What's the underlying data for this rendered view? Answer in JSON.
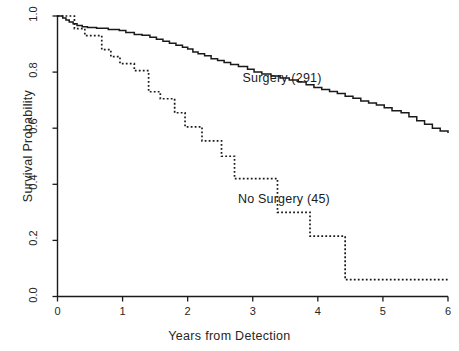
{
  "chart_data": {
    "type": "line",
    "title": "",
    "xlabel": "Years from Detection",
    "ylabel": "Survival Probability",
    "xlim": [
      0,
      6
    ],
    "ylim": [
      0.0,
      1.0
    ],
    "xticks": [
      "0",
      "1",
      "2",
      "3",
      "4",
      "5",
      "6"
    ],
    "yticks": [
      "0.0",
      "0.2",
      "0.4",
      "0.6",
      "0.8",
      "1.0"
    ],
    "grid": false,
    "legend_position": "inline-annotations",
    "plot_style": "kaplan-meier step curves",
    "series": [
      {
        "name": "Surgery (291)",
        "n": 291,
        "linestyle": "solid",
        "color": "#1a1a1a",
        "label_x": 3.45,
        "label_y": 0.775,
        "points": [
          [
            0.0,
            1.0
          ],
          [
            0.08,
            0.993
          ],
          [
            0.13,
            0.986
          ],
          [
            0.18,
            0.979
          ],
          [
            0.24,
            0.972
          ],
          [
            0.3,
            0.966
          ],
          [
            0.38,
            0.962
          ],
          [
            0.46,
            0.959
          ],
          [
            0.6,
            0.956
          ],
          [
            0.78,
            0.952
          ],
          [
            0.95,
            0.948
          ],
          [
            1.05,
            0.941
          ],
          [
            1.18,
            0.934
          ],
          [
            1.3,
            0.931
          ],
          [
            1.42,
            0.924
          ],
          [
            1.52,
            0.917
          ],
          [
            1.62,
            0.91
          ],
          [
            1.72,
            0.903
          ],
          [
            1.82,
            0.896
          ],
          [
            1.92,
            0.889
          ],
          [
            2.0,
            0.882
          ],
          [
            2.08,
            0.872
          ],
          [
            2.16,
            0.865
          ],
          [
            2.26,
            0.858
          ],
          [
            2.36,
            0.848
          ],
          [
            2.46,
            0.841
          ],
          [
            2.56,
            0.834
          ],
          [
            2.66,
            0.827
          ],
          [
            2.78,
            0.82
          ],
          [
            2.92,
            0.81
          ],
          [
            3.02,
            0.8
          ],
          [
            3.14,
            0.793
          ],
          [
            3.28,
            0.786
          ],
          [
            3.42,
            0.779
          ],
          [
            3.56,
            0.772
          ],
          [
            3.7,
            0.765
          ],
          [
            3.82,
            0.755
          ],
          [
            3.94,
            0.745
          ],
          [
            4.06,
            0.738
          ],
          [
            4.18,
            0.731
          ],
          [
            4.3,
            0.724
          ],
          [
            4.42,
            0.714
          ],
          [
            4.54,
            0.707
          ],
          [
            4.66,
            0.697
          ],
          [
            4.78,
            0.69
          ],
          [
            4.9,
            0.683
          ],
          [
            5.02,
            0.673
          ],
          [
            5.14,
            0.662
          ],
          [
            5.28,
            0.655
          ],
          [
            5.4,
            0.641
          ],
          [
            5.52,
            0.627
          ],
          [
            5.64,
            0.614
          ],
          [
            5.76,
            0.6
          ],
          [
            5.88,
            0.59
          ],
          [
            6.0,
            0.586
          ]
        ]
      },
      {
        "name": "No Surgery (45)",
        "n": 45,
        "linestyle": "dotted",
        "color": "#1a1a1a",
        "label_x": 3.48,
        "label_y": 0.345,
        "points": [
          [
            0.0,
            1.0
          ],
          [
            0.26,
            1.0
          ],
          [
            0.26,
            0.955
          ],
          [
            0.42,
            0.955
          ],
          [
            0.42,
            0.93
          ],
          [
            0.68,
            0.93
          ],
          [
            0.68,
            0.88
          ],
          [
            0.82,
            0.88
          ],
          [
            0.82,
            0.855
          ],
          [
            0.96,
            0.855
          ],
          [
            0.96,
            0.83
          ],
          [
            1.18,
            0.83
          ],
          [
            1.18,
            0.805
          ],
          [
            1.4,
            0.805
          ],
          [
            1.4,
            0.73
          ],
          [
            1.58,
            0.73
          ],
          [
            1.58,
            0.705
          ],
          [
            1.8,
            0.705
          ],
          [
            1.8,
            0.655
          ],
          [
            1.96,
            0.655
          ],
          [
            1.96,
            0.605
          ],
          [
            2.22,
            0.605
          ],
          [
            2.22,
            0.555
          ],
          [
            2.52,
            0.555
          ],
          [
            2.52,
            0.5
          ],
          [
            2.72,
            0.5
          ],
          [
            2.72,
            0.42
          ],
          [
            3.38,
            0.42
          ],
          [
            3.38,
            0.3
          ],
          [
            3.88,
            0.3
          ],
          [
            3.88,
            0.215
          ],
          [
            4.42,
            0.215
          ],
          [
            4.42,
            0.06
          ],
          [
            6.0,
            0.06
          ]
        ]
      }
    ]
  },
  "axes": {
    "y_axis_title": "Survival Probability",
    "x_axis_title": "Years from Detection"
  }
}
